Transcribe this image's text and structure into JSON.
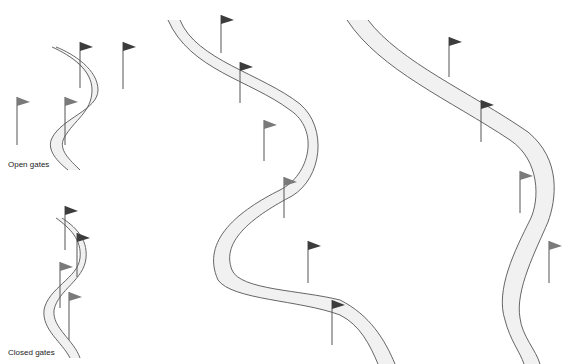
{
  "diagram": {
    "colors": {
      "background": "#ffffff",
      "course_fill": "#f1f1f1",
      "course_edge": "#555555",
      "flag_dark": "#3c3c3c",
      "flag_mid": "#7a7a7a",
      "pole": "#555555",
      "text": "#222222"
    },
    "labels": {
      "open_gates": "Open gates",
      "closed_gates": "Closed gates"
    },
    "panels": [
      {
        "id": "open-gates-example",
        "caption": "Open gates",
        "flags": [
          {
            "x": 80,
            "y_top": 42,
            "y_bottom": 88,
            "shade": "dark"
          },
          {
            "x": 123,
            "y_top": 42,
            "y_bottom": 89,
            "shade": "dark"
          },
          {
            "x": 17,
            "y_top": 97,
            "y_bottom": 145,
            "shade": "mid"
          },
          {
            "x": 65,
            "y_top": 97,
            "y_bottom": 145,
            "shade": "mid"
          }
        ]
      },
      {
        "id": "closed-gates-example",
        "caption": "Closed gates",
        "flags": [
          {
            "x": 65,
            "y_top": 206,
            "y_bottom": 250,
            "shade": "dark"
          },
          {
            "x": 77,
            "y_top": 233,
            "y_bottom": 277,
            "shade": "dark"
          },
          {
            "x": 60,
            "y_top": 262,
            "y_bottom": 308,
            "shade": "mid"
          },
          {
            "x": 69,
            "y_top": 292,
            "y_bottom": 340,
            "shade": "mid"
          }
        ]
      },
      {
        "id": "course-middle",
        "caption": "",
        "flags": [
          {
            "x": 221,
            "y_top": 15,
            "y_bottom": 53,
            "shade": "dark"
          },
          {
            "x": 240,
            "y_top": 62,
            "y_bottom": 103,
            "shade": "dark"
          },
          {
            "x": 264,
            "y_top": 120,
            "y_bottom": 161,
            "shade": "mid"
          },
          {
            "x": 284,
            "y_top": 177,
            "y_bottom": 218,
            "shade": "mid"
          },
          {
            "x": 308,
            "y_top": 241,
            "y_bottom": 283,
            "shade": "dark"
          },
          {
            "x": 332,
            "y_top": 300,
            "y_bottom": 345,
            "shade": "dark"
          }
        ]
      },
      {
        "id": "course-right",
        "caption": "",
        "flags": [
          {
            "x": 449,
            "y_top": 37,
            "y_bottom": 77,
            "shade": "dark"
          },
          {
            "x": 481,
            "y_top": 100,
            "y_bottom": 142,
            "shade": "dark"
          },
          {
            "x": 520,
            "y_top": 171,
            "y_bottom": 213,
            "shade": "mid"
          },
          {
            "x": 549,
            "y_top": 241,
            "y_bottom": 283,
            "shade": "mid"
          }
        ]
      }
    ]
  }
}
